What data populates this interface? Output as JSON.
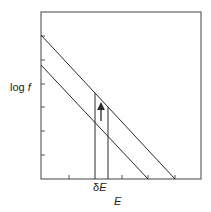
{
  "diagram": {
    "y_label": {
      "prefix": "log ",
      "var": "f"
    },
    "x_label": {
      "var": "E"
    },
    "delta_label": {
      "prefix": "δ",
      "var": "E"
    },
    "colors": {
      "line": "#2a2a2a",
      "frame": "#444444",
      "background": "#ffffff"
    },
    "frame": {
      "x0": 41,
      "y0": 12,
      "x1": 201,
      "y1": 179
    },
    "y_ticks": [
      36,
      60,
      84,
      107,
      131,
      155
    ],
    "x_ticks": [
      69,
      122,
      148,
      175
    ],
    "lines": [
      {
        "name": "upper-line",
        "x0": 41,
        "y0": 35,
        "x1": 175,
        "y1": 179
      },
      {
        "name": "lower-line",
        "x0": 41,
        "y0": 65,
        "x1": 148,
        "y1": 179
      }
    ],
    "delta_lines": [
      {
        "name": "delta-left",
        "x": 95
      },
      {
        "name": "delta-right",
        "x": 108
      }
    ],
    "arrow": {
      "x": 101,
      "y_from": 120,
      "y_to": 104,
      "direction": "up"
    }
  }
}
